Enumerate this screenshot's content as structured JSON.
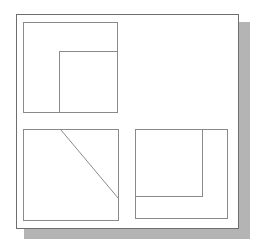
{
  "figure": {
    "background_color": "#ffffff",
    "shadow_color": "#b4b4b4",
    "frame_stroke_color": "#6e6e70",
    "box_stroke_color": "#8a8a8c",
    "fill_color": "#ffffff",
    "width": 257,
    "height": 248
  },
  "outer_frame": {
    "label": "outer border frame",
    "x": 16,
    "y": 14,
    "w": 223,
    "h": 215
  },
  "shadow": {
    "label": "drop shadow",
    "x": 24,
    "y": 22,
    "w": 226,
    "h": 217
  },
  "panels": [
    {
      "name": "top-left-panel",
      "label": "Top left panel",
      "x": 23,
      "y": 22,
      "w": 95,
      "h": 91,
      "subbox": {
        "name": "top-left-subbox",
        "label": "Inner rectangle anchored to bottom-right corner",
        "x": 59,
        "y": 51,
        "w": 59,
        "h": 62
      },
      "diagonal": null
    },
    {
      "name": "bottom-left-panel",
      "label": "Bottom left panel",
      "x": 23,
      "y": 129,
      "w": 96,
      "h": 92,
      "subbox": null,
      "diagonal": {
        "name": "diagonal-line",
        "label": "Diagonal line from top edge to right edge",
        "x1": 61,
        "y1": 130,
        "x2": 118,
        "y2": 198
      }
    },
    {
      "name": "bottom-right-panel",
      "label": "Bottom right panel",
      "x": 135,
      "y": 129,
      "w": 93,
      "h": 90,
      "subbox": {
        "name": "bottom-right-subbox",
        "label": "Inner rectangle anchored to top-left corner",
        "x": 135,
        "y": 129,
        "w": 68,
        "h": 68
      },
      "diagonal": null
    }
  ]
}
